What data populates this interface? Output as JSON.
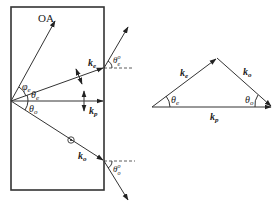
{
  "figure": {
    "left_panel": {
      "crystal_box": {
        "x": 11,
        "y": 7,
        "width": 93,
        "height": 183
      },
      "origin": {
        "x": 11,
        "y": 101
      },
      "labels": {
        "optic_axis": "OA",
        "phi_e": "φ",
        "phi_e_sub": "e",
        "theta_e": "θ",
        "theta_e_sub": "e",
        "theta_o": "θ",
        "theta_o_sub": "o",
        "k_e": "k",
        "k_e_sub": "e",
        "k_p": "k",
        "k_p_sub": "p",
        "k_o": "k",
        "k_o_sub": "o",
        "theta_e_out": "θ",
        "theta_e_out_sub": "e",
        "theta_e_out_sup": "o",
        "theta_o_out": "θ",
        "theta_o_out_sub": "o",
        "theta_o_out_sup": "o"
      },
      "polarization_markers": {
        "k_p": "vertical double arrow",
        "k_e": "in-plane double arrow",
        "k_o": "dot (out of plane)"
      }
    },
    "right_panel": {
      "title": "Wave-vector triangle",
      "vertices": {
        "left": {
          "x": 152,
          "y": 107
        },
        "apex": {
          "x": 217,
          "y": 58
        },
        "right": {
          "x": 272,
          "y": 107
        }
      },
      "labels": {
        "k_e": "k",
        "k_e_sub": "e",
        "k_o": "k",
        "k_o_sub": "o",
        "k_p": "k",
        "k_p_sub": "p",
        "theta_e": "θ",
        "theta_e_sub": "e",
        "theta_o": "θ",
        "theta_o_sub": "o"
      }
    },
    "colors": {
      "stroke": "#333333",
      "text": "#222222",
      "background": "#ffffff"
    }
  }
}
